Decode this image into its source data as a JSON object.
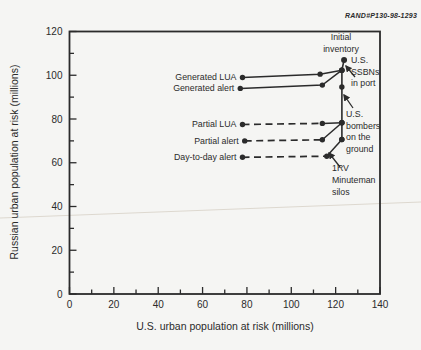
{
  "figure_tag": "RAND#P130-98-1293",
  "colors": {
    "ink": "#2b2b2b",
    "background": "#f5f5f3",
    "crease": "#ddd8cf"
  },
  "chart_data": {
    "type": "line",
    "title": "",
    "xlabel": "U.S. urban population at risk (millions)",
    "ylabel": "Russian urban population at risk (millions)",
    "xlim": [
      0,
      140
    ],
    "ylim": [
      0,
      120
    ],
    "x_ticks": [
      0,
      20,
      40,
      60,
      80,
      100,
      120,
      140
    ],
    "y_ticks": [
      0,
      20,
      40,
      60,
      80,
      100,
      120
    ],
    "minor_tick_step": 10,
    "grid": false,
    "legend": "inline-labels-left-of-lines",
    "series": [
      {
        "name": "Generated LUA",
        "line_style": "solid",
        "points": [
          [
            78,
            99
          ],
          [
            113,
            100.5
          ],
          [
            122.8,
            102.3
          ]
        ]
      },
      {
        "name": "Generated alert",
        "line_style": "solid",
        "points": [
          [
            77,
            94
          ],
          [
            114,
            95.5
          ],
          [
            122.8,
            102.3
          ]
        ]
      },
      {
        "name": "Partial LUA",
        "line_style": "dashed-then-solid",
        "points": [
          [
            78,
            77.5
          ],
          [
            114,
            78
          ],
          [
            122.8,
            78.3
          ]
        ]
      },
      {
        "name": "Partial alert",
        "line_style": "dashed-then-solid",
        "points": [
          [
            79,
            70
          ],
          [
            114,
            70.5
          ],
          [
            122.8,
            78.3
          ]
        ]
      },
      {
        "name": "Day-to-day alert",
        "line_style": "dashed-then-solid",
        "points": [
          [
            78,
            62.5
          ],
          [
            116,
            63
          ],
          [
            122.8,
            70.6
          ]
        ]
      }
    ],
    "inventory_chain": {
      "description": "vertical chain on right showing inventory decrements",
      "points": [
        [
          123.8,
          107
        ],
        [
          122.8,
          102.3
        ],
        [
          122.8,
          94.6
        ],
        [
          122.8,
          78.3
        ],
        [
          122.8,
          70.6
        ]
      ]
    },
    "annotations": [
      {
        "id": "initial-inventory",
        "lines": [
          "Initial",
          "inventory"
        ],
        "x": 341,
        "y": 40,
        "line_height": 12,
        "align": "center",
        "arrow": null
      },
      {
        "id": "us-ssbns-in-port",
        "lines": [
          "U.S.",
          "SSBNs",
          "in port"
        ],
        "x": 351,
        "y": 63,
        "line_height": 11.5,
        "align": "start",
        "arrow": {
          "x1": 355,
          "y1": 77,
          "x2": 346,
          "y2": 66
        }
      },
      {
        "id": "us-bombers-on-the-ground",
        "lines": [
          "U.S.",
          "bombers",
          "on the",
          "ground"
        ],
        "x": 346,
        "y": 117,
        "line_height": 11.5,
        "align": "start",
        "arrow": {
          "x1": 353,
          "y1": 108,
          "x2": 344,
          "y2": 95
        }
      },
      {
        "id": "1rv-minuteman-silos",
        "lines": [
          "1RV",
          "Minuteman",
          "silos"
        ],
        "x": 332,
        "y": 171,
        "line_height": 11.8,
        "align": "start",
        "arrow": {
          "x1": 340,
          "y1": 167,
          "x2": 329,
          "y2": 153
        }
      }
    ]
  }
}
